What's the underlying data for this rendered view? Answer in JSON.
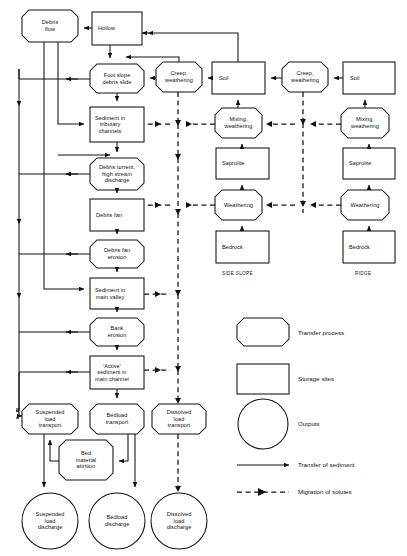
{
  "diagram": {
    "stroke_color": "#111111",
    "background": "#ffffff"
  },
  "nodes": {
    "debris_flow": {
      "label": "Debris\nflow",
      "shape": "octagon"
    },
    "hollow": {
      "label": "Hollow",
      "shape": "rect"
    },
    "foot_slope": {
      "label": "Foot slope\ndebris slide",
      "shape": "octagon"
    },
    "sediment_tributary": {
      "label": "Sediment in\ntributary\nchannels",
      "shape": "rect"
    },
    "debris_torrent": {
      "label": "Debris torrent,\nhigh stream\ndischarge",
      "shape": "octagon"
    },
    "debris_fan": {
      "label": "Debris fan",
      "shape": "rect"
    },
    "debris_fan_erosion": {
      "label": "Debris fan\nerosion",
      "shape": "octagon"
    },
    "sediment_main": {
      "label": "Sediment in\nmain valley",
      "shape": "rect"
    },
    "bank_erosion": {
      "label": "Bank\nerosion",
      "shape": "octagon"
    },
    "active_sediment": {
      "label": "'Active'\nsediment in\nmain channel",
      "shape": "rect"
    },
    "suspended_transport": {
      "label": "Suspended\nload\ntransport",
      "shape": "octagon"
    },
    "bedload_transport": {
      "label": "Bedload\ntransport",
      "shape": "octagon"
    },
    "dissolved_transport": {
      "label": "Dissolved\nload\ntransport",
      "shape": "octagon"
    },
    "bed_material": {
      "label": "Bed\nmaterial\nattrition",
      "shape": "octagon"
    },
    "suspended_discharge": {
      "label": "Suspended\nload\ndischarge",
      "shape": "circle"
    },
    "bedload_discharge": {
      "label": "Bedload\ndischarge",
      "shape": "circle"
    },
    "dissolved_discharge": {
      "label": "Dissolved\nload\ndischarge",
      "shape": "circle"
    },
    "creep_side": {
      "label": "Creep,\nweathering",
      "shape": "octagon"
    },
    "soil_side": {
      "label": "Soil",
      "shape": "rect"
    },
    "mixing_side": {
      "label": "Mixing,\nweathering",
      "shape": "octagon"
    },
    "saprolite_side": {
      "label": "Saprolite",
      "shape": "rect"
    },
    "weathering_side": {
      "label": "Weathering",
      "shape": "octagon"
    },
    "bedrock_side": {
      "label": "Bedrock",
      "shape": "rect"
    },
    "creep_ridge": {
      "label": "Creep,\nweathering",
      "shape": "octagon"
    },
    "soil_ridge": {
      "label": "Soil",
      "shape": "rect"
    },
    "mixing_ridge": {
      "label": "Mixing,\nweathering",
      "shape": "octagon"
    },
    "saprolite_ridge": {
      "label": "Saprolite",
      "shape": "rect"
    },
    "weathering_ridge": {
      "label": "Weathering",
      "shape": "octagon"
    },
    "bedrock_ridge": {
      "label": "Bedrock",
      "shape": "rect"
    }
  },
  "group_labels": {
    "side_slope": "SIDE SLOPE",
    "ridge": "RIDGE"
  },
  "legend": {
    "transfer_process": "Transfer process",
    "storage_sites": "Storage sites",
    "outputs": "Outputs",
    "transfer_of_sediment": "Transfer of sediment",
    "migration_of_solutes": "Migration of solutes"
  }
}
